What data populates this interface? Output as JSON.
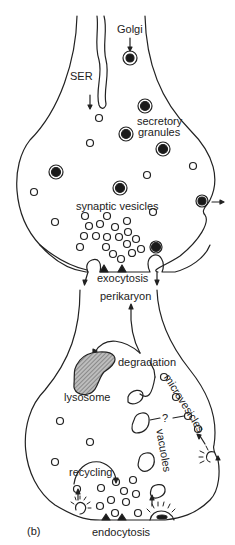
{
  "panel_label": "(b)",
  "top_terminal": {
    "labels": {
      "golgi": "Golgi",
      "ser": "SER",
      "secretory_granules_1": "secretory",
      "secretory_granules_2": "granules",
      "synaptic_vesicles": "synaptic vesicles",
      "exocytosis": "exocytosis"
    }
  },
  "bottom_terminal": {
    "labels": {
      "perikaryon": "perikaryon",
      "degradation": "degradation",
      "lysosome": "lysosome",
      "microvesicles": "microvesicles",
      "question": "?",
      "vacuoles": "vacuoles",
      "recycling": "recycling",
      "endocytosis": "endocytosis"
    }
  },
  "colors": {
    "stroke": "#222222",
    "fill_dark": "#1a1a1a",
    "lysosome_fill": "#9a9a9a",
    "background": "#ffffff"
  }
}
